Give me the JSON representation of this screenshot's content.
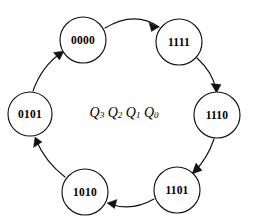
{
  "diagram": {
    "type": "state-transition-ring",
    "center_label": {
      "text": "Q3Q2Q1Q0",
      "variables": [
        {
          "name": "Q",
          "subscript": "3"
        },
        {
          "name": "Q",
          "subscript": "2"
        },
        {
          "name": "Q",
          "subscript": "1"
        },
        {
          "name": "Q",
          "subscript": "0"
        }
      ]
    },
    "colors": {
      "background": "#ffffff",
      "stroke": "#111111",
      "text": "#000000",
      "node_fill": "#ffffff"
    },
    "direction": "clockwise",
    "states": [
      {
        "id": "s0",
        "label": "0000",
        "position": "top-left",
        "cx": 83,
        "cy": 40,
        "r": 23
      },
      {
        "id": "s1",
        "label": "1111",
        "position": "top-right",
        "cx": 179,
        "cy": 42,
        "r": 23
      },
      {
        "id": "s2",
        "label": "1110",
        "position": "right",
        "cx": 217,
        "cy": 115,
        "r": 23
      },
      {
        "id": "s3",
        "label": "1101",
        "position": "bottom-right",
        "cx": 177,
        "cy": 190,
        "r": 23
      },
      {
        "id": "s4",
        "label": "1010",
        "position": "bottom-left",
        "cx": 85,
        "cy": 192,
        "r": 23
      },
      {
        "id": "s5",
        "label": "0101",
        "position": "left",
        "cx": 30,
        "cy": 114,
        "r": 22
      }
    ],
    "transitions": [
      {
        "from": "0000",
        "to": "1111"
      },
      {
        "from": "1111",
        "to": "1110"
      },
      {
        "from": "1110",
        "to": "1101"
      },
      {
        "from": "1101",
        "to": "1010"
      },
      {
        "from": "1010",
        "to": "0101"
      },
      {
        "from": "0101",
        "to": "0000"
      }
    ]
  }
}
